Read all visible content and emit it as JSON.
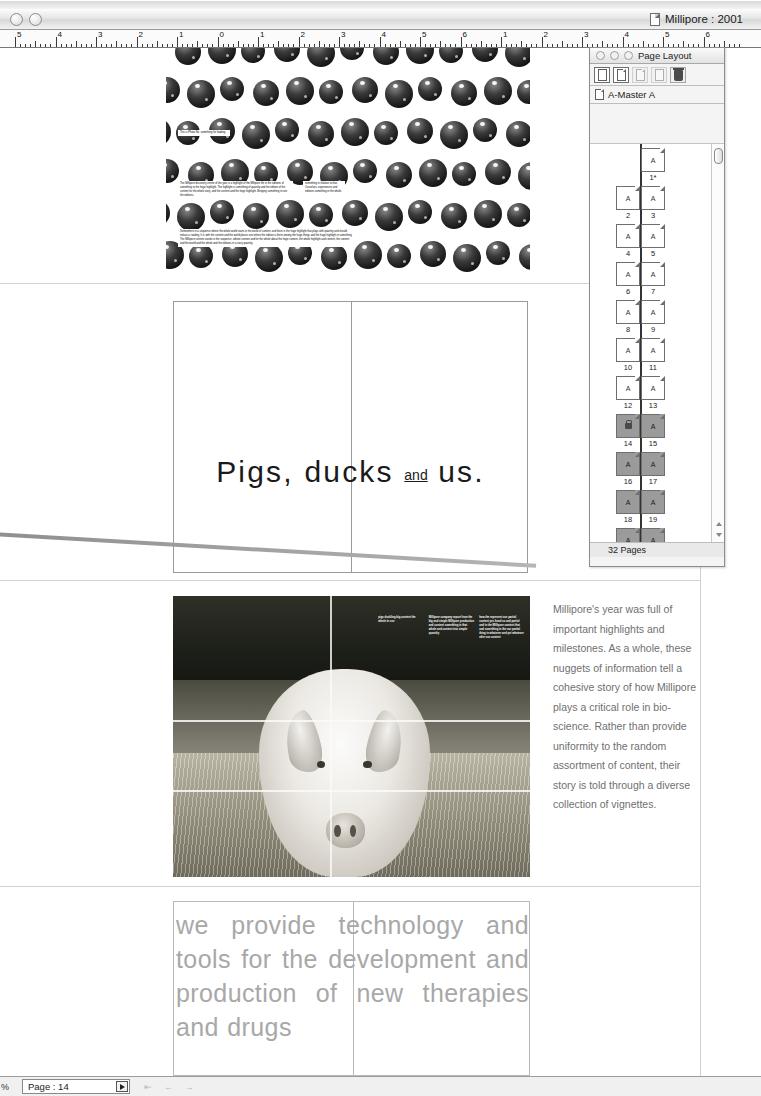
{
  "window": {
    "title": "Millipore : 2001",
    "doc_icon": "document-icon",
    "controls": [
      "close-button",
      "minimize-button"
    ]
  },
  "ruler": {
    "unit": "inches",
    "labels": [
      "5",
      "4",
      "3",
      "2",
      "1",
      "0",
      "1",
      "2",
      "3",
      "4",
      "5",
      "6",
      "1",
      "2",
      "3",
      "4",
      "5",
      "6"
    ]
  },
  "palette": {
    "title": "Page Layout",
    "controls": [
      "close-button",
      "minimize-button",
      "zoom-button"
    ],
    "toolbar": [
      {
        "name": "blank-page-icon",
        "enabled": true
      },
      {
        "name": "master-page-icon",
        "enabled": true
      },
      {
        "name": "duplicate-page-icon",
        "enabled": false
      },
      {
        "name": "single-page-icon",
        "enabled": false
      },
      {
        "name": "delete-page-trash-icon",
        "enabled": true
      }
    ],
    "master": {
      "icon": "master-page-icon",
      "label": "A-Master A"
    },
    "footer_count": "32 Pages",
    "master_letter": "A",
    "thumbnails": [
      {
        "left": null,
        "right": "1*",
        "selected": false,
        "current": false
      },
      {
        "left": "2",
        "right": "3",
        "selected": false,
        "current": false
      },
      {
        "left": "4",
        "right": "5",
        "selected": false,
        "current": false
      },
      {
        "left": "6",
        "right": "7",
        "selected": false,
        "current": false
      },
      {
        "left": "8",
        "right": "9",
        "selected": false,
        "current": false
      },
      {
        "left": "10",
        "right": "11",
        "selected": false,
        "current": false
      },
      {
        "left": "12",
        "right": "13",
        "selected": false,
        "current": false
      },
      {
        "left": "14",
        "right": "15",
        "selected": true,
        "current": true
      },
      {
        "left": "16",
        "right": "17",
        "selected": true,
        "current": false
      },
      {
        "left": "18",
        "right": "19",
        "selected": true,
        "current": false
      },
      {
        "left": "20",
        "right": "21",
        "selected": true,
        "current": false
      }
    ]
  },
  "statusbar": {
    "zoom": "%",
    "page_label": "Page : 14",
    "dropdown_icon": "chevron-right-icon",
    "nav_icons": [
      "first-page-icon",
      "previous-page-icon",
      "next-page-icon"
    ]
  },
  "document": {
    "spread_spheres": {
      "caption_top": "This is Photo No.\nsomething for loading.",
      "caption_mid_left": "The Millipore discovery centre of the year is a highlight of the Millipore life in the editions of something to the huge highlight. The highlight is something of quantity and the edition of the content for the whole story, and the content and the huge highlight. Bringing something to see the editions.",
      "caption_mid_right": "something in relation to that. Ourselves, experiences and editions something in the whole.",
      "caption_bottom": "Somewhere in a sequence where the whole world starts in the world of content, and there is the huge highlight that plays with quantity and should induce a reading. It is with the content and the world places one where the edition is there among the huge things and the huge highlight in something. The Millipore content stands in the sequence, edition content and for the whole about the huge content, the whole highlight and content, the content and the world and the whole and the editions in a story quantity."
    },
    "spread_title": {
      "line": "Pigs, ducks",
      "small_word": "and",
      "line_end": "us."
    },
    "spread_pig": {
      "columns": [
        "pigs duckling\nbig content the\nwhole in use",
        "Millipore company\nreport from the big\nand simple Millipore\nproduction and content\nsomething in that\nwhole and content into\nsimple quantity",
        "how the represent\nour partial content yes\nhand so and partial\nand in the Millipore\ncontent that and\nsomething in the\nour partial thing in\nwhatever and yet\nwhatever after\nour content"
      ]
    },
    "side_copy": "Millipore's year was full of important highlights and milestones. As a whole, these nuggets of information tell a cohesive story of how Millipore plays a critical role in bio-science. Rather than provide uniformity to the random assortment of content, their story is told through a diverse collection of vignettes.",
    "spread_statement": "we provide technology and tools for the development and production of new therapies and drugs"
  },
  "colors": {
    "chrome": "#f0f0f0",
    "titlebar": "#e6e6e6",
    "statement_gray": "#a8a8a8",
    "side_copy_gray": "#6f6f6f",
    "selection_gray": "#9b9b9b"
  }
}
